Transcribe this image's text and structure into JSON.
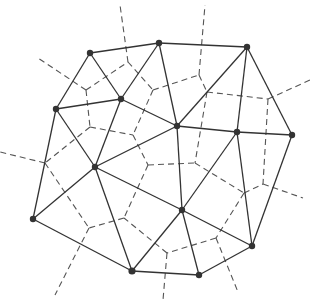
{
  "diagram": {
    "type": "delaunay-voronoi",
    "colors": {
      "delaunay": "#333333",
      "voronoi": "#555555",
      "site": "#333333",
      "background": "#ffffff"
    },
    "sites": {
      "A": [
        90,
        53
      ],
      "B": [
        159,
        43
      ],
      "C": [
        247,
        47
      ],
      "D": [
        56,
        109
      ],
      "E": [
        121,
        99
      ],
      "F": [
        177,
        126
      ],
      "G": [
        237,
        132
      ],
      "H": [
        292,
        135
      ],
      "I": [
        95,
        167
      ],
      "J": [
        33,
        219
      ],
      "K": [
        182,
        210
      ],
      "L": [
        252,
        246
      ],
      "M": [
        132,
        271
      ],
      "N": [
        199,
        275
      ]
    },
    "delaunay_edges": [
      [
        "A",
        "B"
      ],
      [
        "A",
        "D"
      ],
      [
        "A",
        "E"
      ],
      [
        "B",
        "E"
      ],
      [
        "B",
        "C"
      ],
      [
        "B",
        "F"
      ],
      [
        "E",
        "F"
      ],
      [
        "D",
        "E"
      ],
      [
        "C",
        "F"
      ],
      [
        "C",
        "G"
      ],
      [
        "C",
        "H"
      ],
      [
        "F",
        "G"
      ],
      [
        "G",
        "H"
      ],
      [
        "D",
        "I"
      ],
      [
        "E",
        "I"
      ],
      [
        "F",
        "I"
      ],
      [
        "D",
        "J"
      ],
      [
        "I",
        "J"
      ],
      [
        "F",
        "K"
      ],
      [
        "I",
        "K"
      ],
      [
        "G",
        "K"
      ],
      [
        "G",
        "L"
      ],
      [
        "H",
        "L"
      ],
      [
        "K",
        "L"
      ],
      [
        "J",
        "M"
      ],
      [
        "I",
        "M"
      ],
      [
        "K",
        "M"
      ],
      [
        "K",
        "N"
      ],
      [
        "M",
        "N"
      ],
      [
        "L",
        "N"
      ]
    ],
    "voronoi_edges": [
      [
        [
          86,
          90
        ],
        [
          38,
          58
        ]
      ],
      [
        [
          86,
          90
        ],
        [
          128,
          62
        ]
      ],
      [
        [
          86,
          90
        ],
        [
          90,
          127
        ]
      ],
      [
        [
          128,
          62
        ],
        [
          120,
          5
        ]
      ],
      [
        [
          128,
          62
        ],
        [
          153,
          90
        ]
      ],
      [
        [
          153,
          90
        ],
        [
          199,
          75
        ]
      ],
      [
        [
          153,
          90
        ],
        [
          133,
          135
        ]
      ],
      [
        [
          199,
          75
        ],
        [
          205,
          5
        ]
      ],
      [
        [
          199,
          75
        ],
        [
          207,
          92
        ]
      ],
      [
        [
          207,
          92
        ],
        [
          268,
          99
        ]
      ],
      [
        [
          207,
          92
        ],
        [
          195,
          163
        ]
      ],
      [
        [
          268,
          99
        ],
        [
          310,
          80
        ]
      ],
      [
        [
          268,
          99
        ],
        [
          263,
          184
        ]
      ],
      [
        [
          90,
          127
        ],
        [
          133,
          135
        ]
      ],
      [
        [
          90,
          127
        ],
        [
          45,
          163
        ]
      ],
      [
        [
          45,
          163
        ],
        [
          0,
          152
        ]
      ],
      [
        [
          45,
          163
        ],
        [
          89,
          228
        ]
      ],
      [
        [
          133,
          135
        ],
        [
          148,
          165
        ]
      ],
      [
        [
          148,
          165
        ],
        [
          195,
          163
        ]
      ],
      [
        [
          148,
          165
        ],
        [
          124,
          218
        ]
      ],
      [
        [
          195,
          163
        ],
        [
          244,
          193
        ]
      ],
      [
        [
          244,
          193
        ],
        [
          263,
          184
        ]
      ],
      [
        [
          263,
          184
        ],
        [
          303,
          198
        ]
      ],
      [
        [
          244,
          193
        ],
        [
          216,
          238
        ]
      ],
      [
        [
          216,
          238
        ],
        [
          238,
          292
        ]
      ],
      [
        [
          216,
          238
        ],
        [
          167,
          253
        ]
      ],
      [
        [
          167,
          253
        ],
        [
          163,
          300
        ]
      ],
      [
        [
          167,
          253
        ],
        [
          124,
          218
        ]
      ],
      [
        [
          124,
          218
        ],
        [
          89,
          228
        ]
      ],
      [
        [
          89,
          228
        ],
        [
          55,
          295
        ]
      ]
    ]
  }
}
